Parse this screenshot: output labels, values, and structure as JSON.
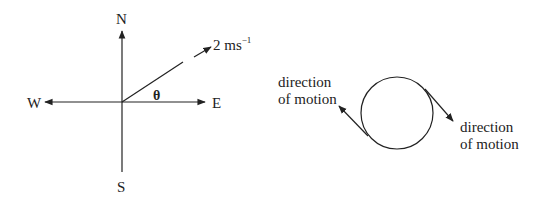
{
  "compass_diagram": {
    "north_label": "N",
    "south_label": "S",
    "east_label": "E",
    "west_label": "W",
    "angle_label": "θ",
    "velocity_label": "2 ms",
    "velocity_unit_exponent": "−1"
  },
  "circle_diagram": {
    "left_label_line1": "direction",
    "left_label_line2": "of motion",
    "right_label_line1": "direction",
    "right_label_line2": "of motion"
  },
  "colors": {
    "stroke": "#222222",
    "background": "#ffffff"
  }
}
